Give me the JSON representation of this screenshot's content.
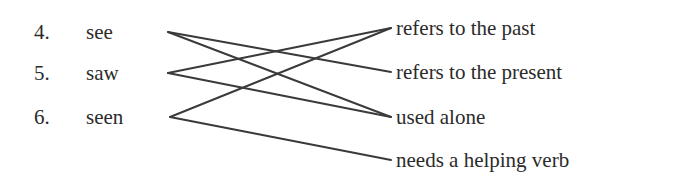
{
  "exercise": {
    "type": "matching-exercise",
    "left_column": {
      "label": "verb-forms",
      "items": [
        {
          "number": "4.",
          "word": "see",
          "x": 168,
          "y": 32
        },
        {
          "number": "5.",
          "word": "saw",
          "x": 168,
          "y": 73
        },
        {
          "number": "6.",
          "word": "seen",
          "x": 170,
          "y": 117
        }
      ]
    },
    "right_column": {
      "label": "descriptions",
      "items": [
        {
          "text": "refers to the past",
          "x": 391,
          "y": 28
        },
        {
          "text": "refers to the present",
          "x": 391,
          "y": 72
        },
        {
          "text": "used alone",
          "x": 391,
          "y": 117
        },
        {
          "text": "needs a helping verb",
          "x": 391,
          "y": 160
        }
      ]
    },
    "connections": [
      {
        "from": 0,
        "to": 1,
        "x1": 168,
        "y1": 32,
        "x2": 391,
        "y2": 72
      },
      {
        "from": 0,
        "to": 2,
        "x1": 168,
        "y1": 32,
        "x2": 391,
        "y2": 117
      },
      {
        "from": 1,
        "to": 0,
        "x1": 168,
        "y1": 73,
        "x2": 391,
        "y2": 28
      },
      {
        "from": 1,
        "to": 2,
        "x1": 168,
        "y1": 73,
        "x2": 391,
        "y2": 117
      },
      {
        "from": 2,
        "to": 0,
        "x1": 170,
        "y1": 117,
        "x2": 391,
        "y2": 28
      },
      {
        "from": 2,
        "to": 3,
        "x1": 170,
        "y1": 117,
        "x2": 391,
        "y2": 160
      }
    ],
    "colors": {
      "background": "#ffffff",
      "text": "#2b2b2b",
      "line": "#3a3a3a"
    }
  }
}
